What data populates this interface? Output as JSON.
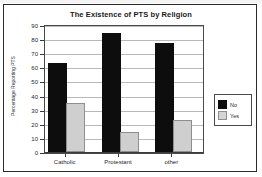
{
  "chart_data": {
    "type": "bar",
    "title": "The Existence of PTS by Religion",
    "xlabel": "",
    "ylabel": "Percentage Reporting PTS",
    "categories": [
      "Catholic",
      "Protestant",
      "other"
    ],
    "series": [
      {
        "name": "No",
        "values": [
          62,
          83,
          76
        ],
        "color": "#0d0d0d"
      },
      {
        "name": "Yes",
        "values": [
          33,
          13,
          21
        ],
        "color": "#cfcfcf"
      }
    ],
    "ylim": [
      0,
      90
    ],
    "ytick_step": 10,
    "yticks": [
      "90",
      "80",
      "70",
      "60",
      "50",
      "40",
      "30",
      "20",
      "10",
      "0"
    ],
    "grid": true,
    "legend_position": "right"
  },
  "legend": {
    "items": [
      {
        "label": "No"
      },
      {
        "label": "Yes"
      }
    ]
  }
}
